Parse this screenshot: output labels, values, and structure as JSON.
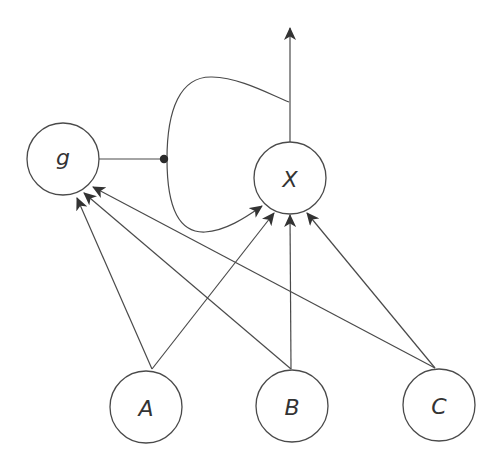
{
  "diagram": {
    "type": "directed-graph",
    "background": "#ffffff",
    "stroke_color": "#4a4a4a",
    "nodes": [
      {
        "id": "g",
        "label": "g",
        "cx": 63,
        "cy": 159,
        "r": 36
      },
      {
        "id": "X",
        "label": "X",
        "cx": 290,
        "cy": 178,
        "r": 36
      },
      {
        "id": "A",
        "label": "A",
        "cx": 146,
        "cy": 407,
        "r": 36
      },
      {
        "id": "B",
        "label": "B",
        "cx": 292,
        "cy": 406,
        "r": 36
      },
      {
        "id": "C",
        "label": "C",
        "cx": 439,
        "cy": 405,
        "r": 36
      }
    ],
    "edges": [
      {
        "from": "A",
        "to": "g",
        "type": "arrow"
      },
      {
        "from": "B",
        "to": "g",
        "type": "arrow"
      },
      {
        "from": "C",
        "to": "g",
        "type": "arrow"
      },
      {
        "from": "A",
        "to": "X",
        "type": "arrow"
      },
      {
        "from": "B",
        "to": "X",
        "type": "arrow"
      },
      {
        "from": "C",
        "to": "X",
        "type": "arrow"
      },
      {
        "from": "X",
        "to": "output",
        "type": "arrow",
        "direction": "up"
      },
      {
        "from": "X-output",
        "to": "X",
        "type": "feedback-loop-arrow"
      },
      {
        "from": "g",
        "to": "feedback-loop",
        "type": "dot-modulator"
      }
    ]
  }
}
